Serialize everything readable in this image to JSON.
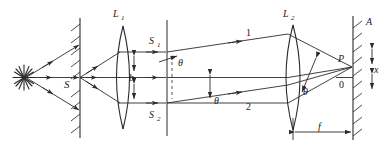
{
  "figure": {
    "type": "optical-ray-diagram",
    "background_color": "#ffffff",
    "line_color": "#2b2b2b",
    "canvas": {
      "width": 387,
      "height": 156
    }
  },
  "labels": {
    "source": "",
    "slit_s": "S",
    "lens_1": "L",
    "lens_1_sub": "1",
    "slit_s1": "S",
    "slit_s1_sub": "1",
    "slit_s2": "S",
    "slit_s2_sub": "2",
    "slit_separation": "b",
    "theta_slit": "θ",
    "theta_ray2": "θ",
    "ray_1": "1",
    "ray_2": "2",
    "lens_2": "L",
    "lens_2_sub": "2",
    "theta_focus": "θ",
    "point_p": "P",
    "origin": "0",
    "displacement": "x",
    "screen_a": "A",
    "focal_length": "f"
  },
  "elements": {
    "light_source_icon": "star-burst-icon",
    "slit_screen_icon": "hatched-screen-icon",
    "lens_icon": "biconvex-lens-icon",
    "observation_screen_icon": "hatched-screen-icon",
    "ray_arrow_icon": "arrow-head-icon",
    "dimension_arrow_icon": "double-headed-arrow-icon"
  }
}
